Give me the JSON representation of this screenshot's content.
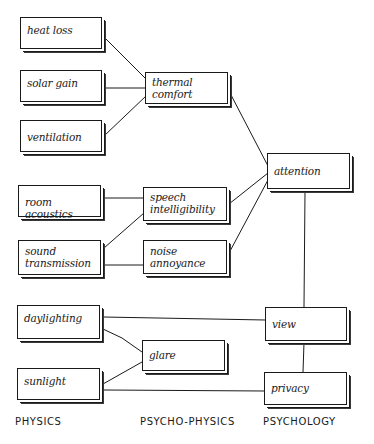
{
  "diagram": {
    "columns": [
      {
        "id": "physics",
        "label": "PHYSICS",
        "x": 20
      },
      {
        "id": "psychophysics",
        "label": "PSYCHO-PHYSICS",
        "x": 140
      },
      {
        "id": "psychology",
        "label": "PSYCHOLOGY",
        "x": 263
      }
    ],
    "nodes": {
      "heat_loss": {
        "label": "heat loss",
        "column": "physics"
      },
      "solar_gain": {
        "label": "solar gain",
        "column": "physics"
      },
      "ventilation": {
        "label": "ventilation",
        "column": "physics"
      },
      "room_acoustics": {
        "label": "room acoustics",
        "column": "physics"
      },
      "sound_transmission_l1": {
        "label": "sound",
        "column": "physics"
      },
      "sound_transmission_l2": {
        "label": "transmission",
        "column": "physics"
      },
      "daylighting": {
        "label": "daylighting",
        "column": "physics"
      },
      "sunlight": {
        "label": "sunlight",
        "column": "physics"
      },
      "thermal_comfort_l1": {
        "label": "thermal",
        "column": "psychophysics"
      },
      "thermal_comfort_l2": {
        "label": "comfort",
        "column": "psychophysics"
      },
      "speech_intelligibility_l1": {
        "label": "speech",
        "column": "psychophysics"
      },
      "speech_intelligibility_l2": {
        "label": "intelligibility",
        "column": "psychophysics"
      },
      "noise_annoyance_l1": {
        "label": "noise",
        "column": "psychophysics"
      },
      "noise_annoyance_l2": {
        "label": "annoyance",
        "column": "psychophysics"
      },
      "glare": {
        "label": "glare",
        "column": "psychophysics"
      },
      "attention": {
        "label": "attention",
        "column": "psychology"
      },
      "view": {
        "label": "view",
        "column": "psychology"
      },
      "privacy": {
        "label": "privacy",
        "column": "psychology"
      }
    },
    "edges": [
      [
        "heat loss",
        "thermal comfort"
      ],
      [
        "solar gain",
        "thermal comfort"
      ],
      [
        "ventilation",
        "thermal comfort"
      ],
      [
        "thermal comfort",
        "attention"
      ],
      [
        "room acoustics",
        "speech intelligibility"
      ],
      [
        "sound transmission",
        "speech intelligibility"
      ],
      [
        "sound transmission",
        "noise annoyance"
      ],
      [
        "speech intelligibility",
        "attention"
      ],
      [
        "noise annoyance",
        "attention"
      ],
      [
        "attention",
        "view"
      ],
      [
        "daylighting",
        "view"
      ],
      [
        "daylighting",
        "glare"
      ],
      [
        "sunlight",
        "glare"
      ],
      [
        "sunlight",
        "privacy"
      ],
      [
        "view",
        "privacy"
      ]
    ],
    "colors": {
      "ink": "#1a1a1a",
      "paper": "#ffffff"
    }
  }
}
